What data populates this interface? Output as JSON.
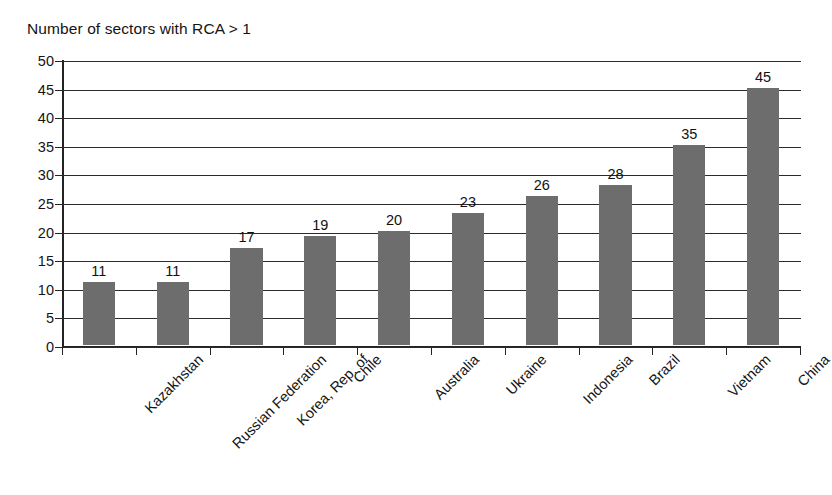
{
  "chart_data": {
    "type": "bar",
    "title": "Number of sectors with RCA > 1",
    "xlabel": "",
    "ylabel": "",
    "ylim": [
      0,
      50
    ],
    "ytick_step": 5,
    "grid": true,
    "legend": false,
    "orientation": "vertical",
    "bar_color": "#6d6d6d",
    "axis_color": "#232323",
    "background_color": "#ffffff",
    "label_rotation_deg": -45,
    "categories": [
      "Kazakhstan",
      "Russian Federation",
      "Korea, Rep. of",
      "Chile",
      "Australia",
      "Ukraine",
      "Indonesia",
      "Brazil",
      "Vietnam",
      "China"
    ],
    "values": [
      11,
      11,
      17,
      19,
      20,
      23,
      26,
      28,
      35,
      45
    ],
    "value_labels": [
      "11",
      "11",
      "17",
      "19",
      "20",
      "23",
      "26",
      "28",
      "35",
      "45"
    ],
    "yticks": [
      0,
      5,
      10,
      15,
      20,
      25,
      30,
      35,
      40,
      45,
      50
    ],
    "ytick_labels": [
      "0",
      "5",
      "10",
      "15",
      "20",
      "25",
      "30",
      "35",
      "40",
      "45",
      "50"
    ]
  }
}
